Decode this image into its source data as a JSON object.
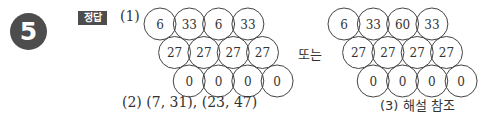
{
  "problem_number": "5",
  "answer_label": "정답",
  "part1": {
    "label": "(1)",
    "or_text": "또는",
    "grid_a": {
      "rows": [
        [
          "6",
          "33",
          "6",
          "33"
        ],
        [
          "27",
          "27",
          "27",
          "27"
        ],
        [
          "0",
          "0",
          "0",
          "0"
        ]
      ]
    },
    "grid_b": {
      "rows": [
        [
          "6",
          "33",
          "60",
          "33"
        ],
        [
          "27",
          "27",
          "27",
          "27"
        ],
        [
          "0",
          "0",
          "0",
          "0"
        ]
      ]
    }
  },
  "part2": {
    "text": "(2) (7, 31), (23, 47)"
  },
  "part3": {
    "text": "(3) 해설 참조"
  }
}
